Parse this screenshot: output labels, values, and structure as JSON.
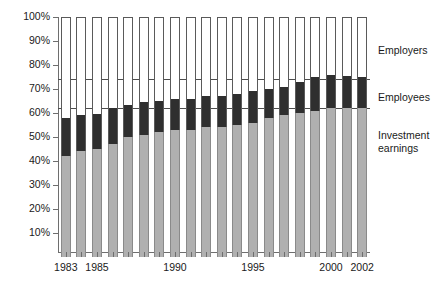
{
  "chart_data": {
    "type": "bar",
    "subtype": "stacked-percentage-column",
    "title": "",
    "xlabel": "",
    "ylabel": "",
    "ylim": [
      0,
      100
    ],
    "y_unit": "%",
    "grid": false,
    "legend_position": "right",
    "categories": [
      "1983",
      "1984",
      "1985",
      "1986",
      "1987",
      "1988",
      "1989",
      "1990",
      "1991",
      "1992",
      "1993",
      "1994",
      "1995",
      "1996",
      "1997",
      "1998",
      "1999",
      "2000",
      "2001",
      "2002"
    ],
    "x_tick_labels": [
      {
        "category": "1983",
        "label": "1983"
      },
      {
        "category": "1985",
        "label": "1985"
      },
      {
        "category": "1990",
        "label": "1990"
      },
      {
        "category": "1995",
        "label": "1995"
      },
      {
        "category": "2000",
        "label": "2000"
      },
      {
        "category": "2002",
        "label": "2002"
      }
    ],
    "y_tick_labels": [
      "10%",
      "20%",
      "30%",
      "40%",
      "50%",
      "60%",
      "70%",
      "80%",
      "90%",
      "100%"
    ],
    "y_tick_values": [
      10,
      20,
      30,
      40,
      50,
      60,
      70,
      80,
      90,
      100
    ],
    "reference_lines": [
      {
        "value": 62,
        "label": ""
      },
      {
        "value": 74,
        "label": ""
      }
    ],
    "series": [
      {
        "name": "Investment earnings",
        "color": "#b0b0b0",
        "values": [
          42,
          44,
          45,
          47,
          50,
          51,
          52,
          53,
          53,
          54,
          54,
          55,
          56,
          58,
          59,
          60,
          61,
          62,
          62,
          62
        ]
      },
      {
        "name": "Employees",
        "color": "#2f2f2f",
        "values": [
          16,
          15,
          14.5,
          15,
          13.5,
          13.5,
          13,
          13,
          13,
          13,
          13,
          13,
          13,
          12,
          12,
          13,
          14,
          14,
          13.5,
          13
        ]
      },
      {
        "name": "Employers",
        "color": "#ffffff",
        "values": [
          42,
          41,
          40.5,
          38,
          36.5,
          35.5,
          35,
          34,
          34,
          33,
          33,
          32,
          31,
          30,
          29,
          27,
          25,
          24,
          24.5,
          25
        ]
      }
    ],
    "stack_tops": {
      "investment_earnings": [
        42,
        44,
        45,
        47,
        50,
        51,
        52,
        53,
        53,
        54,
        54,
        55,
        56,
        58,
        59,
        60,
        61,
        62,
        62,
        62
      ],
      "employees": [
        58,
        59,
        59.5,
        62,
        63.5,
        64.5,
        65,
        66,
        66,
        67,
        67,
        68,
        69,
        70,
        71,
        73,
        75,
        76,
        75.5,
        75
      ],
      "employers": [
        100,
        100,
        100,
        100,
        100,
        100,
        100,
        100,
        100,
        100,
        100,
        100,
        100,
        100,
        100,
        100,
        100,
        100,
        100,
        100
      ]
    }
  },
  "legend": {
    "items": [
      {
        "key": "employers",
        "label": "Employers"
      },
      {
        "key": "employees",
        "label": "Employees"
      },
      {
        "key": "investment",
        "label": "Investment\nearnings"
      }
    ]
  }
}
